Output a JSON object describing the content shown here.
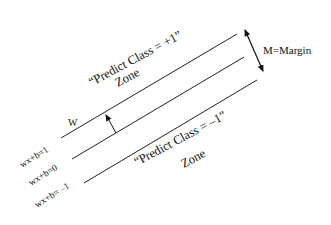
{
  "diagram": {
    "zone_positive": {
      "line1": "“Predict Class = +1”",
      "line2": "Zone"
    },
    "zone_negative": {
      "line1": "“Predict Class = –1”",
      "line2": "Zone"
    },
    "margin_label": "M=Margin",
    "w_label": "W",
    "hyperplanes": [
      {
        "label": "wx+b=1"
      },
      {
        "label": "wx+b=0"
      },
      {
        "label": "wx+b= –1"
      }
    ],
    "colors": {
      "line": "#222222",
      "text": "#111111",
      "background": "#ffffff"
    }
  }
}
